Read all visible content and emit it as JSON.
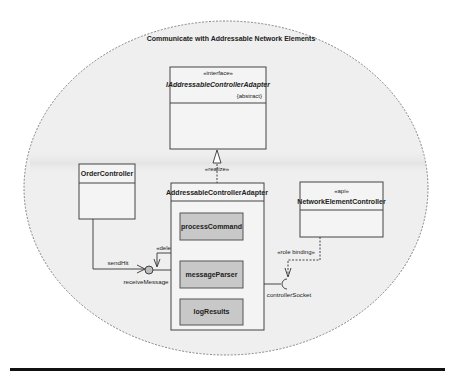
{
  "diagram": {
    "title": "Communicate with Addressable Network Elements",
    "colors": {
      "ellipse_fill": "#efefef",
      "ellipse_stroke": "#777777",
      "box_fill": "#f4f4f4",
      "box_stroke": "#444444",
      "part_fill": "#c8c8c8",
      "line": "#333333",
      "rule": "#111111"
    },
    "interface_box": {
      "stereotype": "«interface»",
      "name": "IAddressableControllerAdapter",
      "modifier": "{abstract}"
    },
    "realize_label": "«realize»",
    "order_controller": {
      "name": "OrderController"
    },
    "adapter": {
      "name": "AddressableControllerAdapter",
      "parts": [
        {
          "name": "processCommand"
        },
        {
          "name": "messageParser"
        },
        {
          "name": "logResults"
        }
      ]
    },
    "network_controller": {
      "stereotype": "«api»",
      "name": "NetworkElementController"
    },
    "connectors": {
      "send_label": "sendHit",
      "provided_port_label": "receiveMessage",
      "delegate_label": "«delegate»",
      "role_binding_label": "«role binding»",
      "required_port_label": "controllerSocket"
    }
  }
}
